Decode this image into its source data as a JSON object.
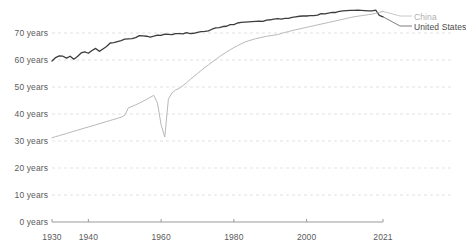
{
  "chart_data": {
    "type": "line",
    "title": "",
    "subtitle": "",
    "xlabel": "",
    "ylabel": "",
    "xlim": [
      1930,
      2021
    ],
    "ylim": [
      0,
      76
    ],
    "grid": true,
    "legend_position": "right",
    "y_ticks": [
      0,
      10,
      20,
      30,
      40,
      50,
      60,
      70
    ],
    "y_tick_labels": [
      "0 years",
      "10 years",
      "20 years",
      "30 years",
      "40 years",
      "50 years",
      "60 years",
      "70 years"
    ],
    "x_ticks": [
      1930,
      1940,
      1960,
      1980,
      2000,
      2021
    ],
    "x_tick_labels": [
      "1930",
      "1940",
      "1960",
      "1980",
      "2000",
      "2021"
    ],
    "series": [
      {
        "name": "United States",
        "color": "#3d3d3d",
        "x": [
          1930,
          1931,
          1932,
          1933,
          1934,
          1935,
          1936,
          1937,
          1938,
          1939,
          1940,
          1941,
          1942,
          1943,
          1944,
          1945,
          1946,
          1947,
          1948,
          1949,
          1950,
          1951,
          1952,
          1953,
          1954,
          1955,
          1956,
          1957,
          1958,
          1959,
          1960,
          1961,
          1962,
          1963,
          1964,
          1965,
          1966,
          1967,
          1968,
          1969,
          1970,
          1971,
          1972,
          1973,
          1974,
          1975,
          1976,
          1977,
          1978,
          1979,
          1980,
          1981,
          1982,
          1983,
          1984,
          1985,
          1986,
          1987,
          1988,
          1989,
          1990,
          1991,
          1992,
          1993,
          1994,
          1995,
          1996,
          1997,
          1998,
          1999,
          2000,
          2001,
          2002,
          2003,
          2004,
          2005,
          2006,
          2007,
          2008,
          2009,
          2010,
          2011,
          2012,
          2013,
          2014,
          2015,
          2016,
          2017,
          2018,
          2019,
          2020,
          2021
        ],
        "values": [
          59.6,
          60.9,
          61.5,
          61.4,
          60.7,
          61.4,
          60.3,
          61.3,
          62.6,
          63.0,
          62.5,
          63.5,
          64.3,
          63.2,
          64.1,
          65.0,
          66.3,
          66.4,
          66.8,
          67.2,
          67.7,
          67.8,
          67.9,
          68.3,
          69.0,
          68.9,
          68.8,
          68.5,
          68.8,
          69.2,
          69.1,
          69.6,
          69.5,
          69.4,
          69.8,
          69.8,
          69.7,
          70.1,
          69.8,
          69.9,
          70.2,
          70.5,
          70.6,
          70.8,
          71.4,
          71.9,
          72.0,
          72.4,
          72.5,
          73.1,
          73.1,
          73.7,
          73.9,
          74.0,
          74.1,
          74.2,
          74.3,
          74.4,
          74.3,
          74.8,
          74.9,
          75.1,
          75.3,
          75.1,
          75.4,
          75.4,
          75.8,
          76.0,
          76.2,
          76.3,
          76.3,
          76.4,
          76.4,
          76.6,
          77.2,
          77.1,
          77.4,
          77.6,
          77.6,
          78.0,
          78.2,
          78.3,
          78.4,
          78.4,
          78.5,
          78.4,
          78.3,
          78.2,
          78.2,
          78.5,
          76.5,
          76.0
        ]
      },
      {
        "name": "China",
        "color": "#b8b8b8",
        "x": [
          1930,
          1931,
          1932,
          1933,
          1934,
          1935,
          1936,
          1937,
          1938,
          1939,
          1940,
          1941,
          1942,
          1943,
          1944,
          1945,
          1946,
          1947,
          1948,
          1949,
          1950,
          1951,
          1952,
          1953,
          1954,
          1955,
          1956,
          1957,
          1958,
          1959,
          1960,
          1961,
          1962,
          1963,
          1964,
          1965,
          1966,
          1967,
          1968,
          1969,
          1970,
          1971,
          1972,
          1973,
          1974,
          1975,
          1976,
          1977,
          1978,
          1979,
          1980,
          1981,
          1982,
          1983,
          1984,
          1985,
          1986,
          1987,
          1988,
          1989,
          1990,
          1991,
          1992,
          1993,
          1994,
          1995,
          1996,
          1997,
          1998,
          1999,
          2000,
          2001,
          2002,
          2003,
          2004,
          2005,
          2006,
          2007,
          2008,
          2009,
          2010,
          2011,
          2012,
          2013,
          2014,
          2015,
          2016,
          2017,
          2018,
          2019,
          2020,
          2021
        ],
        "values": [
          31.2,
          31.6,
          32.0,
          32.4,
          32.8,
          33.2,
          33.6,
          34.0,
          34.4,
          34.8,
          35.2,
          35.6,
          36.0,
          36.4,
          36.8,
          37.2,
          37.6,
          38.0,
          38.4,
          38.8,
          39.5,
          42.3,
          42.8,
          43.4,
          44.0,
          44.7,
          45.4,
          46.2,
          46.9,
          44.0,
          36.0,
          31.5,
          45.5,
          47.8,
          48.9,
          49.5,
          50.5,
          51.6,
          52.8,
          53.9,
          55.0,
          56.1,
          57.2,
          58.2,
          59.2,
          60.2,
          61.2,
          62.1,
          63.0,
          63.8,
          64.6,
          65.3,
          66.0,
          66.6,
          67.1,
          67.5,
          67.9,
          68.2,
          68.5,
          68.8,
          69.0,
          69.2,
          69.4,
          69.8,
          70.2,
          70.5,
          70.9,
          71.2,
          71.5,
          71.8,
          72.1,
          72.4,
          72.7,
          73.0,
          73.3,
          73.6,
          73.9,
          74.2,
          74.5,
          74.8,
          75.1,
          75.4,
          75.7,
          76.0,
          76.2,
          76.4,
          76.6,
          76.8,
          77.0,
          77.3,
          77.6,
          78.0
        ]
      }
    ]
  },
  "legend": {
    "items": [
      {
        "label": "China",
        "color": "#b0b0b0"
      },
      {
        "label": "United States",
        "color": "#4a4a4a"
      }
    ]
  },
  "axes": {
    "y_labels": [
      "70 years",
      "60 years",
      "50 years",
      "40 years",
      "30 years",
      "20 years",
      "10 years",
      "0 years"
    ],
    "x_labels": [
      "1930",
      "1940",
      "1960",
      "1980",
      "2000",
      "2021"
    ]
  }
}
